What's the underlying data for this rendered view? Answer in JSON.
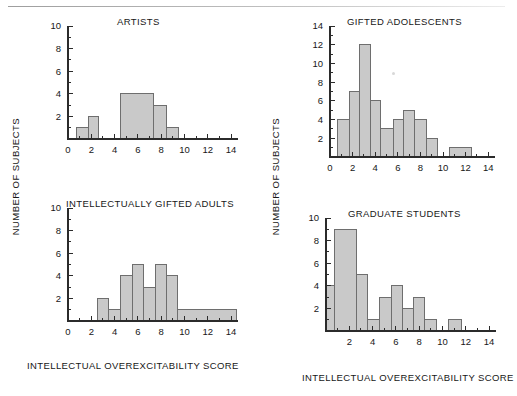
{
  "figure": {
    "axis_label_x": "INTELLECTUAL OVEREXCITABILITY SCORE",
    "axis_label_y": "NUMBER OF SUBJECTS",
    "bar_fill": "#c9c9c9",
    "bar_stroke": "#6e6e6e",
    "axis_color": "#2b2b2b",
    "background": "#ffffff"
  },
  "chart_data": [
    {
      "id": "artists",
      "type": "bar",
      "title": "ARTISTS",
      "xlabel": "INTELLECTUAL OVEREXCITABILITY SCORE",
      "ylabel": "NUMBER OF SUBJECTS",
      "xlim": [
        0,
        14.6
      ],
      "ylim": [
        0,
        10
      ],
      "xticks": [
        0,
        2,
        4,
        6,
        8,
        10,
        12,
        14
      ],
      "yticks": [
        2,
        4,
        6,
        8,
        10
      ],
      "xminor_step": 1,
      "yminor_step": 1,
      "grid": false,
      "legend": "none",
      "bins": [
        {
          "start": 0.7,
          "end": 1.75,
          "value": 1
        },
        {
          "start": 1.75,
          "end": 2.6,
          "value": 2
        },
        {
          "start": 4.5,
          "end": 7.3,
          "value": 4
        },
        {
          "start": 7.3,
          "end": 8.45,
          "value": 3
        },
        {
          "start": 8.45,
          "end": 9.45,
          "value": 1
        }
      ]
    },
    {
      "id": "gifted-adolescents",
      "type": "bar",
      "title": "GIFTED ADOLESCENTS",
      "xlabel": "INTELLECTUAL OVEREXCITABILITY SCORE",
      "ylabel": "NUMBER OF SUBJECTS",
      "xlim": [
        0,
        14.6
      ],
      "ylim": [
        0,
        14
      ],
      "xticks": [
        0,
        2,
        4,
        6,
        8,
        10,
        12,
        14
      ],
      "yticks": [
        2,
        4,
        6,
        8,
        10,
        12,
        14
      ],
      "xminor_step": 1,
      "yminor_step": 1,
      "grid": false,
      "legend": "none",
      "bins": [
        {
          "start": 0.7,
          "end": 1.75,
          "value": 4
        },
        {
          "start": 1.75,
          "end": 2.6,
          "value": 7
        },
        {
          "start": 2.6,
          "end": 3.6,
          "value": 12
        },
        {
          "start": 3.6,
          "end": 4.5,
          "value": 6
        },
        {
          "start": 4.5,
          "end": 5.6,
          "value": 3
        },
        {
          "start": 5.6,
          "end": 6.5,
          "value": 4
        },
        {
          "start": 6.5,
          "end": 7.5,
          "value": 5
        },
        {
          "start": 7.5,
          "end": 8.5,
          "value": 4
        },
        {
          "start": 8.5,
          "end": 9.5,
          "value": 2
        },
        {
          "start": 10.6,
          "end": 12.5,
          "value": 1
        }
      ]
    },
    {
      "id": "intellectually-gifted-adults",
      "type": "bar",
      "title": "INTELLECTUALLY GIFTED ADULTS",
      "xlabel": "INTELLECTUAL OVEREXCITABILITY SCORE",
      "ylabel": "NUMBER OF SUBJECTS",
      "xlim": [
        0,
        14.6
      ],
      "ylim": [
        0,
        10
      ],
      "xticks": [
        0,
        2,
        4,
        6,
        8,
        10,
        12,
        14
      ],
      "yticks": [
        2,
        4,
        6,
        8,
        10
      ],
      "xminor_step": 1,
      "yminor_step": 1,
      "grid": false,
      "legend": "none",
      "bins": [
        {
          "start": 2.5,
          "end": 3.45,
          "value": 2
        },
        {
          "start": 3.45,
          "end": 4.5,
          "value": 1
        },
        {
          "start": 4.5,
          "end": 5.5,
          "value": 4
        },
        {
          "start": 5.5,
          "end": 6.5,
          "value": 5
        },
        {
          "start": 6.5,
          "end": 7.5,
          "value": 3
        },
        {
          "start": 7.5,
          "end": 8.5,
          "value": 5
        },
        {
          "start": 8.5,
          "end": 9.4,
          "value": 4
        },
        {
          "start": 9.4,
          "end": 14.5,
          "value": 1
        }
      ]
    },
    {
      "id": "graduate-students",
      "type": "bar",
      "title": "GRADUATE STUDENTS",
      "xlabel": "INTELLECTUAL OVEREXCITABILITY SCORE",
      "ylabel": "NUMBER OF SUBJECTS",
      "xlim": [
        0,
        14.6
      ],
      "ylim": [
        0,
        10
      ],
      "xticks": [
        2,
        4,
        6,
        8,
        10,
        12,
        14
      ],
      "yticks": [
        2,
        4,
        6,
        8,
        10
      ],
      "xminor_step": 1,
      "yminor_step": 1,
      "grid": false,
      "legend": "none",
      "bins": [
        {
          "start": 0.0,
          "end": 0.75,
          "value": 4
        },
        {
          "start": 0.75,
          "end": 2.6,
          "value": 9
        },
        {
          "start": 2.6,
          "end": 3.6,
          "value": 5
        },
        {
          "start": 3.6,
          "end": 4.6,
          "value": 1
        },
        {
          "start": 4.6,
          "end": 5.6,
          "value": 3
        },
        {
          "start": 5.6,
          "end": 6.6,
          "value": 4
        },
        {
          "start": 6.6,
          "end": 7.5,
          "value": 2
        },
        {
          "start": 7.5,
          "end": 8.5,
          "value": 3
        },
        {
          "start": 8.5,
          "end": 9.5,
          "value": 1
        },
        {
          "start": 10.5,
          "end": 11.6,
          "value": 1
        }
      ]
    }
  ]
}
